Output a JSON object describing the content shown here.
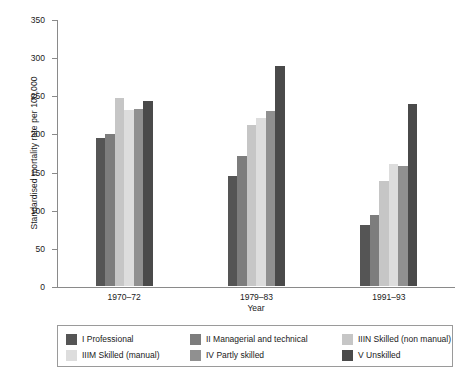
{
  "chart_data": {
    "type": "bar",
    "title": "",
    "xlabel": "Year",
    "ylabel": "Standardised mortality rate per 100,000",
    "categories": [
      "1970–72",
      "1979–83",
      "1991–93"
    ],
    "ylim": [
      0,
      350
    ],
    "yticks": [
      0,
      50,
      100,
      150,
      200,
      250,
      300,
      350
    ],
    "ytick_labels": [
      "0",
      "50",
      "100",
      "150",
      "200",
      "250",
      "300",
      "350"
    ],
    "grid": false,
    "legend_position": "bottom",
    "series": [
      {
        "name": "I Professional",
        "color": "#555555",
        "values": [
          194,
          144,
          80
        ]
      },
      {
        "name": "II Managerial and technical",
        "color": "#7d7d7d",
        "values": [
          199,
          170,
          93
        ]
      },
      {
        "name": "IIIN Skilled (non manual)",
        "color": "#c6c6c6",
        "values": [
          246,
          211,
          138
        ]
      },
      {
        "name": "IIIM Skilled (manual)",
        "color": "#dddddd",
        "values": [
          231,
          220,
          160
        ]
      },
      {
        "name": "IV Partly skilled",
        "color": "#909090",
        "values": [
          232,
          229,
          157
        ]
      },
      {
        "name": "V Unskilled",
        "color": "#4a4a4a",
        "values": [
          243,
          288,
          238
        ]
      }
    ]
  },
  "legend": {
    "items": [
      {
        "label": "I Professional",
        "color": "#555555"
      },
      {
        "label": "II Managerial and technical",
        "color": "#7d7d7d"
      },
      {
        "label": "IIIN Skilled (non manual)",
        "color": "#c6c6c6"
      },
      {
        "label": "IIIM Skilled (manual)",
        "color": "#dddddd"
      },
      {
        "label": "IV Partly skilled",
        "color": "#909090"
      },
      {
        "label": "V Unskilled",
        "color": "#4a4a4a"
      }
    ]
  }
}
